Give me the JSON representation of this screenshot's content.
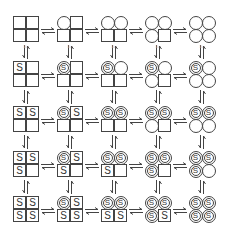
{
  "diagram": {
    "subunit_order": [
      "top-left",
      "top-right",
      "bottom-left",
      "bottom-right"
    ],
    "ligand_label": "S",
    "rows": 5,
    "cols": 5,
    "col_labels": [
      "1k",
      "1k",
      "1k",
      "1k",
      "1k"
    ],
    "colors": {
      "stroke": "#444444",
      "background": "#ffffff",
      "label": "#cccccc"
    },
    "arrow_type": "reversible-equilibrium"
  }
}
